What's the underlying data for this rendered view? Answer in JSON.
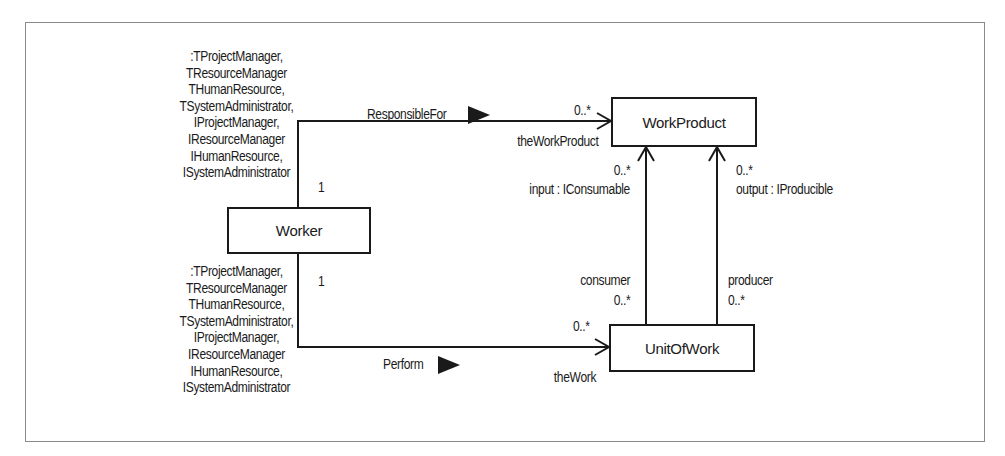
{
  "figure": {
    "classes": {
      "worker": "Worker",
      "work_product": "WorkProduct",
      "unit_of_work": "UnitOfWork"
    },
    "associations": {
      "responsible_for": {
        "name": "ResponsibleFor",
        "source_multiplicity": "1",
        "target_multiplicity": "0..*",
        "target_role": "theWorkProduct",
        "source_roles": [
          ":TProjectManager,",
          "TResourceManager",
          "THumanResource,",
          "TSystemAdministrator,",
          "IProjectManager,",
          "IResourceManager",
          "IHumanResource,",
          "ISystemAdministrator"
        ]
      },
      "perform": {
        "name": "Perform",
        "source_multiplicity": "1",
        "target_multiplicity": "0..*",
        "target_role": "theWork",
        "source_roles": [
          ":TProjectManager,",
          "TResourceManager",
          "THumanResource,",
          "TSystemAdministrator,",
          "IProjectManager,",
          "IResourceManager",
          "IHumanResource,",
          "ISystemAdministrator"
        ]
      },
      "input": {
        "target_multiplicity": "0..*",
        "target_role": "input : IConsumable",
        "source_role": "consumer",
        "source_multiplicity": "0..*"
      },
      "output": {
        "target_multiplicity": "0..*",
        "target_role": "output : IProducible",
        "source_role": "producer",
        "source_multiplicity": "0..*"
      }
    }
  }
}
